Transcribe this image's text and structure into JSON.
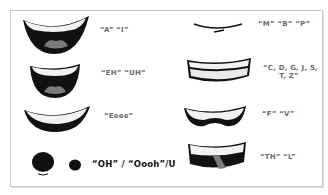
{
  "diagram": {
    "title": "",
    "colors": {
      "border": "#c8c8c8",
      "ink": "#111111",
      "teeth": "#f2f2f2",
      "tongue": "#7a7a7a",
      "label_gray": "#6b6b6b",
      "label_dark": "#111111"
    },
    "shapes": [
      {
        "id": "A-I",
        "label": "“A” “I”"
      },
      {
        "id": "EH-UH",
        "label": "“EH” “UH”"
      },
      {
        "id": "Eeee",
        "label": "“Eeee”"
      },
      {
        "id": "OH-Oooh-U",
        "label": "“OH” / “Oooh”/U"
      },
      {
        "id": "M-B-P",
        "label": "“M” “B” “P”"
      },
      {
        "id": "CDGJSTZ",
        "label_line1": "“C, D, G, J, S,",
        "label_line2": "T, Z”"
      },
      {
        "id": "F-V",
        "label": "“F” “V”"
      },
      {
        "id": "TH-L",
        "label": "“TH” “L”"
      }
    ]
  }
}
